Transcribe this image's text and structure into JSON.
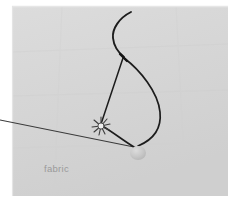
{
  "figure": {
    "canvas": {
      "width": 238,
      "height": 206
    },
    "background_color": "#ffffff",
    "panel": {
      "name": "fabric-panel",
      "x": 12,
      "y": 6,
      "width": 216,
      "height": 190,
      "fill_color": "#d6d6d6",
      "edge_highlight_color": "#e2e2e2",
      "shadow_color": "#c9c9c9"
    },
    "labels": [
      {
        "id": "fabric",
        "text": "fabric",
        "x": 44,
        "y": 172,
        "color": "#9a9a9a",
        "font_size_px": 9.5
      }
    ],
    "elements": [
      {
        "id": "needle",
        "name": "curved-needle",
        "description": "curved sewing needle arcing from upper right down to the thread junction",
        "color": "#1c1c1c",
        "stroke_width": 1.9,
        "path": "M 131 12 C 119 18 112 29 113 38 C 114 48 119 53 124 57"
      },
      {
        "id": "thread-loop-outer",
        "name": "thread-loop",
        "description": "large thread loop from needle junction curving right and down to the bead",
        "color": "#1c1c1c",
        "stroke_width": 1.7,
        "path": "M 124 58 C 140 70 158 92 160 112 C 162 131 150 141 138 146"
      },
      {
        "id": "thread-taut",
        "name": "thread-taut-segment",
        "description": "straight thread running from needle junction down-left to the puncture knot",
        "color": "#1c1c1c",
        "stroke_width": 1.5,
        "path": "M 123 58 L 101 124"
      },
      {
        "id": "thread-lower",
        "name": "thread-lower-segment",
        "description": "thread from puncture knot curving right to the bead",
        "color": "#1c1c1c",
        "stroke_width": 1.6,
        "path": "M 104 127 C 114 133 124 141 134 147"
      },
      {
        "id": "thread-tail",
        "name": "thread-tail",
        "description": "long straight thread tail exiting the left edge of the frame",
        "color": "#3a3a3a",
        "stroke_width": 1.1,
        "path": "M 0 120 L 139 148"
      },
      {
        "id": "puncture",
        "name": "puncture-burst",
        "description": "small star burst where the needle pierces the fabric",
        "x": 101,
        "y": 126,
        "radius": 8,
        "spokes": 9,
        "color": "#3c3c3c"
      },
      {
        "id": "bead",
        "name": "bead",
        "description": "small pale bead / knot at the bottom of the thread",
        "x": 138,
        "y": 153,
        "rx": 8,
        "ry": 7,
        "fill_color": "#c3c3c3",
        "highlight_color": "#d2d2d2"
      }
    ]
  }
}
